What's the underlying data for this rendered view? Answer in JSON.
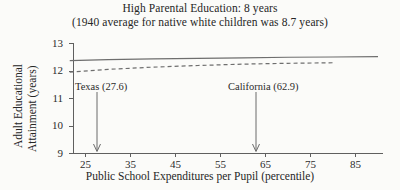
{
  "chart_data": {
    "type": "line",
    "title": "High Parental Education: 8 years",
    "subtitle": "(1940 average for native white children was 8.7 years)",
    "xlabel": "Public School Expenditures per Pupil (percentile)",
    "ylabel_line1": "Adult Educational",
    "ylabel_line2": "Attainment (years)",
    "xlim": [
      20,
      90
    ],
    "ylim": [
      9,
      13
    ],
    "xticks": [
      25,
      35,
      45,
      55,
      65,
      75,
      85
    ],
    "xtick_labels": [
      "25",
      "35",
      "45",
      "55",
      "65",
      "75",
      "85"
    ],
    "yticks": [
      9,
      10,
      11,
      12,
      13
    ],
    "ytick_labels": [
      "9",
      "10",
      "11",
      "12",
      "13"
    ],
    "grid": false,
    "legend": "none",
    "series": [
      {
        "name": "solid-upper",
        "style": "solid",
        "x": [
          21.5,
          30,
          40,
          50,
          60,
          70,
          80,
          90
        ],
        "values": [
          12.38,
          12.41,
          12.44,
          12.46,
          12.48,
          12.5,
          12.51,
          12.52
        ]
      },
      {
        "name": "dashed-lower",
        "style": "dashed",
        "x": [
          21.5,
          30,
          40,
          50,
          60,
          70,
          80
        ],
        "values": [
          11.96,
          12.06,
          12.14,
          12.2,
          12.25,
          12.28,
          12.3
        ]
      }
    ],
    "annotations": [
      {
        "name": "texas",
        "label": "Texas (27.6)",
        "x": 27.6,
        "arrow_to_y": 9.0
      },
      {
        "name": "california",
        "label": "California (62.9)",
        "x": 62.9,
        "arrow_to_y": 9.0
      }
    ]
  }
}
